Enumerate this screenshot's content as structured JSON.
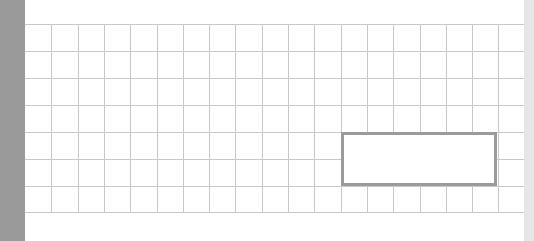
{
  "canvas": {
    "width": 534,
    "height": 241,
    "background": "#ffffff"
  },
  "left_bar": {
    "color": "#9a9a9a",
    "width": 25
  },
  "right_strip": {
    "color": "#e6e6e6",
    "x": 524
  },
  "grid": {
    "line_color": "#c8c8c8",
    "origin_x": 25,
    "origin_y": 24,
    "width": 499,
    "height": 189,
    "rows": 7,
    "columns": 19,
    "row_height": 27,
    "column_width": 26.3
  },
  "selection_rect": {
    "x": 341,
    "y": 132,
    "width": 156,
    "height": 54,
    "border_color": "#9b9b9b",
    "border_width": 3
  }
}
